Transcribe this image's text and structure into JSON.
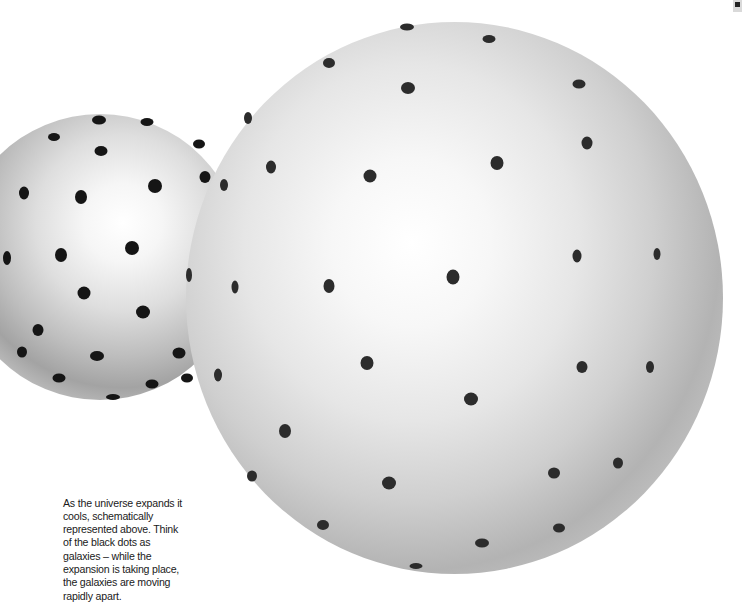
{
  "caption": {
    "text": "As the universe expands it cools, schematically represented above. Think of the black dots as galaxies – while the expansion is taking place, the galaxies are moving rapidly apart."
  },
  "illustration": {
    "small_sphere": {
      "label": "earlier-universe-sphere",
      "dots": [
        [
          99,
          120,
          14,
          9
        ],
        [
          147,
          122,
          13,
          8
        ],
        [
          54,
          137,
          12,
          8
        ],
        [
          101,
          151,
          13,
          10
        ],
        [
          199,
          144,
          12,
          9
        ],
        [
          205,
          177,
          11,
          12
        ],
        [
          155,
          186,
          14,
          14
        ],
        [
          81,
          197,
          12,
          14
        ],
        [
          24,
          193,
          10,
          13
        ],
        [
          132,
          248,
          14,
          14
        ],
        [
          61,
          255,
          12,
          14
        ],
        [
          7,
          258,
          8,
          14
        ],
        [
          84,
          293,
          13,
          13
        ],
        [
          143,
          312,
          14,
          13
        ],
        [
          38,
          330,
          11,
          12
        ],
        [
          22,
          352,
          10,
          11
        ],
        [
          97,
          356,
          14,
          10
        ],
        [
          179,
          353,
          13,
          11
        ],
        [
          59,
          378,
          13,
          9
        ],
        [
          152,
          384,
          13,
          9
        ],
        [
          187,
          378,
          12,
          9
        ],
        [
          113,
          397,
          14,
          6
        ]
      ]
    },
    "large_sphere": {
      "label": "later-universe-sphere",
      "dots": [
        [
          407,
          27,
          14,
          7
        ],
        [
          489,
          39,
          13,
          8
        ],
        [
          329,
          63,
          12,
          10
        ],
        [
          408,
          88,
          14,
          12
        ],
        [
          579,
          84,
          13,
          9
        ],
        [
          248,
          118,
          8,
          12
        ],
        [
          587,
          143,
          11,
          13
        ],
        [
          497,
          163,
          13,
          14
        ],
        [
          271,
          167,
          10,
          13
        ],
        [
          370,
          176,
          13,
          13
        ],
        [
          224,
          185,
          8,
          12
        ],
        [
          453,
          277,
          13,
          15
        ],
        [
          329,
          286,
          11,
          14
        ],
        [
          235,
          287,
          7,
          13
        ],
        [
          189,
          275,
          6,
          14
        ],
        [
          577,
          256,
          9,
          13
        ],
        [
          657,
          254,
          7,
          12
        ],
        [
          367,
          363,
          13,
          14
        ],
        [
          582,
          367,
          11,
          12
        ],
        [
          650,
          367,
          8,
          12
        ],
        [
          218,
          375,
          8,
          13
        ],
        [
          471,
          399,
          14,
          13
        ],
        [
          285,
          431,
          12,
          14
        ],
        [
          252,
          476,
          10,
          11
        ],
        [
          389,
          483,
          14,
          13
        ],
        [
          554,
          473,
          12,
          11
        ],
        [
          618,
          463,
          10,
          11
        ],
        [
          323,
          525,
          12,
          10
        ],
        [
          559,
          528,
          12,
          9
        ],
        [
          482,
          543,
          14,
          9
        ],
        [
          416,
          566,
          13,
          6
        ]
      ]
    }
  },
  "colors": {
    "background": "#ffffff",
    "dot": "#151515",
    "caption_text": "#1a1a1a"
  }
}
